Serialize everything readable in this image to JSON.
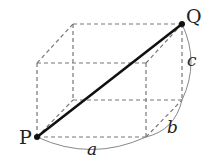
{
  "diagram": {
    "type": "cuboid-space-diagonal",
    "points": {
      "P": {
        "label": "P",
        "x": 37,
        "y": 137
      },
      "Q": {
        "label": "Q",
        "x": 182,
        "y": 24
      }
    },
    "dimensions": {
      "a": {
        "label": "a"
      },
      "b": {
        "label": "b"
      },
      "c": {
        "label": "c"
      }
    },
    "colors": {
      "edge": "#777777",
      "diagonal": "#111111",
      "arc": "#888888",
      "text": "#222222"
    }
  }
}
